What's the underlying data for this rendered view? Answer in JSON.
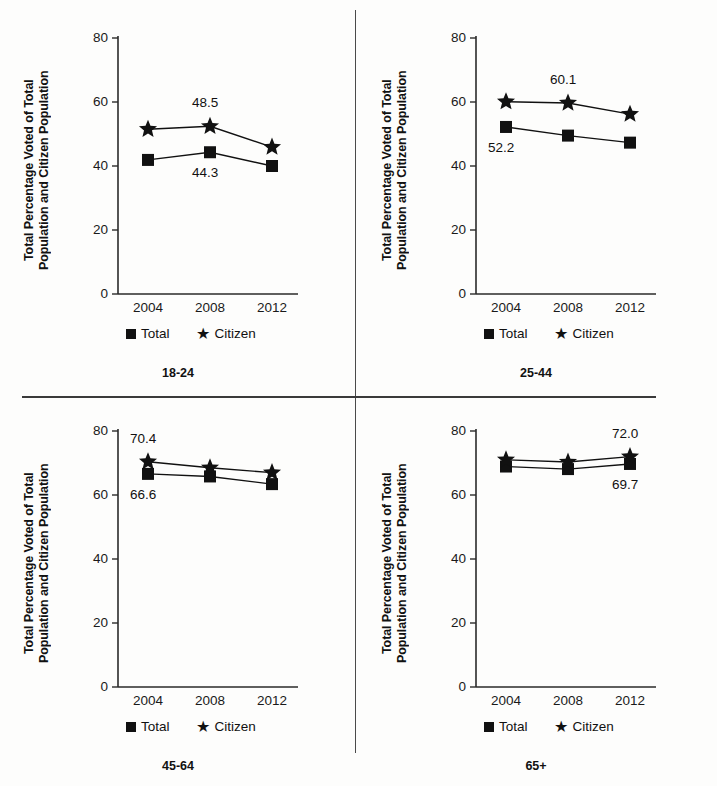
{
  "figure": {
    "ylabel": "Total Percentage Voted of Total\nPopulation and Citizen Population",
    "legend": {
      "total": "Total",
      "citizen": "Citizen"
    },
    "marker_total": "square",
    "marker_citizen": "star",
    "color_ink": "#111111"
  },
  "chart_data": [
    {
      "type": "line",
      "title": "18-24",
      "xlabel": "",
      "ylabel": "Total Percentage Voted of Total Population and Citizen Population",
      "categories": [
        "2004",
        "2008",
        "2012"
      ],
      "yticks": [
        0,
        20,
        40,
        60,
        80
      ],
      "ylim": [
        0,
        80
      ],
      "grid": false,
      "legend_position": "below-axis",
      "series": [
        {
          "name": "Total",
          "marker": "square",
          "values": [
            41.9,
            44.3,
            40.0
          ]
        },
        {
          "name": "Citizen",
          "marker": "star",
          "values": [
            51.5,
            52.4,
            45.9
          ]
        }
      ],
      "annotations": [
        {
          "text": "48.5",
          "series": "Citizen",
          "category": "2008",
          "placement": "above"
        },
        {
          "text": "44.3",
          "series": "Total",
          "category": "2008",
          "placement": "below"
        }
      ]
    },
    {
      "type": "line",
      "title": "25-44",
      "xlabel": "",
      "ylabel": "Total Percentage Voted of Total Population and Citizen Population",
      "categories": [
        "2004",
        "2008",
        "2012"
      ],
      "yticks": [
        0,
        20,
        40,
        60,
        80
      ],
      "ylim": [
        0,
        80
      ],
      "grid": false,
      "legend_position": "below-axis",
      "series": [
        {
          "name": "Total",
          "marker": "square",
          "values": [
            52.2,
            49.5,
            47.3
          ]
        },
        {
          "name": "Citizen",
          "marker": "star",
          "values": [
            60.1,
            59.7,
            56.2
          ]
        }
      ],
      "annotations": [
        {
          "text": "60.1",
          "series": "Citizen",
          "category": "2008",
          "placement": "above"
        },
        {
          "text": "52.2",
          "series": "Total",
          "category": "2004",
          "placement": "below"
        }
      ]
    },
    {
      "type": "line",
      "title": "45-64",
      "xlabel": "",
      "ylabel": "Total Percentage Voted of Total Population and Citizen Population",
      "categories": [
        "2004",
        "2008",
        "2012"
      ],
      "yticks": [
        0,
        20,
        40,
        60,
        80
      ],
      "ylim": [
        0,
        80
      ],
      "grid": false,
      "legend_position": "below-axis",
      "series": [
        {
          "name": "Total",
          "marker": "square",
          "values": [
            66.6,
            65.8,
            63.4
          ]
        },
        {
          "name": "Citizen",
          "marker": "star",
          "values": [
            70.4,
            68.5,
            67.0
          ]
        }
      ],
      "annotations": [
        {
          "text": "70.4",
          "series": "Citizen",
          "category": "2004",
          "placement": "above"
        },
        {
          "text": "66.6",
          "series": "Total",
          "category": "2004",
          "placement": "below"
        }
      ]
    },
    {
      "type": "line",
      "title": "65+",
      "xlabel": "",
      "ylabel": "Total Percentage Voted of Total Population and Citizen Population",
      "categories": [
        "2004",
        "2008",
        "2012"
      ],
      "yticks": [
        0,
        20,
        40,
        60,
        80
      ],
      "ylim": [
        0,
        80
      ],
      "grid": false,
      "legend_position": "below-axis",
      "series": [
        {
          "name": "Total",
          "marker": "square",
          "values": [
            68.9,
            68.1,
            69.7
          ]
        },
        {
          "name": "Citizen",
          "marker": "star",
          "values": [
            71.0,
            70.3,
            72.0
          ]
        }
      ],
      "annotations": [
        {
          "text": "72.0",
          "series": "Citizen",
          "category": "2012",
          "placement": "above"
        },
        {
          "text": "69.7",
          "series": "Total",
          "category": "2012",
          "placement": "below"
        }
      ]
    }
  ]
}
